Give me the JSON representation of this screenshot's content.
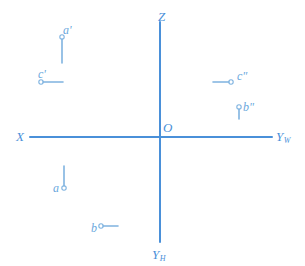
{
  "figure": {
    "type": "orthographic-projection-axes",
    "background_color": "#ffffff",
    "axis_color": "#4a90d9",
    "marker_color": "#7fb3e0",
    "label_color": "#5b9bd5"
  },
  "axes": {
    "origin": {
      "label": "O",
      "x": 160,
      "y": 137
    },
    "vertical_z": {
      "label": "Z",
      "label_x": 158,
      "label_y": 10,
      "x": 160,
      "y1": 22,
      "y2": 137
    },
    "vertical_yh": {
      "label": "Y",
      "subscript": "H",
      "label_x": 152,
      "label_y": 248,
      "x": 160,
      "y1": 137,
      "y2": 242
    },
    "horizontal_x": {
      "label": "X",
      "label_x": 16,
      "label_y": 130,
      "y": 137,
      "x1": 30,
      "x2": 160
    },
    "horizontal_yw": {
      "label": "Y",
      "subscript": "W",
      "label_x": 276,
      "label_y": 130,
      "y": 137,
      "x1": 160,
      "x2": 272
    }
  },
  "points": [
    {
      "id": "a-prime",
      "label": "a",
      "prime": "'",
      "label_x": 63,
      "label_y": 24,
      "circle_x": 62,
      "circle_y": 37,
      "circle_r": 2.2,
      "tick": {
        "x1": 62,
        "y1": 39,
        "x2": 62,
        "y2": 63
      },
      "tick_orientation": "vertical-down"
    },
    {
      "id": "c-prime",
      "label": "c",
      "prime": "'",
      "label_x": 38,
      "label_y": 68,
      "circle_x": 41,
      "circle_y": 82,
      "circle_r": 2.2,
      "tick": {
        "x1": 43,
        "y1": 82,
        "x2": 63,
        "y2": 82
      },
      "tick_orientation": "horizontal-right"
    },
    {
      "id": "c-double-prime",
      "label": "c",
      "prime": "\"",
      "label_x": 237,
      "label_y": 70,
      "circle_x": 231,
      "circle_y": 82,
      "circle_r": 2.2,
      "tick": {
        "x1": 213,
        "y1": 82,
        "x2": 229,
        "y2": 82
      },
      "tick_orientation": "horizontal-left"
    },
    {
      "id": "b-double-prime",
      "label": "b",
      "prime": "\"",
      "label_x": 243,
      "label_y": 101,
      "circle_x": 239,
      "circle_y": 107,
      "circle_r": 2.2,
      "tick": {
        "x1": 239,
        "y1": 109,
        "x2": 239,
        "y2": 119
      },
      "tick_orientation": "vertical-down"
    },
    {
      "id": "a",
      "label": "a",
      "prime": "",
      "label_x": 53,
      "label_y": 182,
      "circle_x": 64,
      "circle_y": 188,
      "circle_r": 2.2,
      "tick": {
        "x1": 64,
        "y1": 166,
        "x2": 64,
        "y2": 186
      },
      "tick_orientation": "vertical-up"
    },
    {
      "id": "b",
      "label": "b",
      "prime": "",
      "label_x": 91,
      "label_y": 222,
      "circle_x": 101,
      "circle_y": 226,
      "circle_r": 2.2,
      "tick": {
        "x1": 103,
        "y1": 226,
        "x2": 118,
        "y2": 226
      },
      "tick_orientation": "horizontal-right"
    }
  ]
}
